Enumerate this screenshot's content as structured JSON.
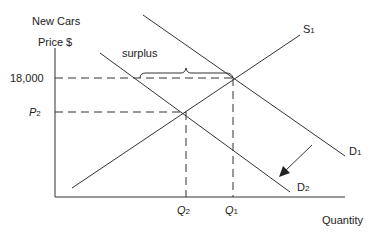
{
  "diagram": {
    "title_line1": "New Cars",
    "y_axis_label": "Price $",
    "x_axis_label": "Quantity",
    "price_labels": {
      "p1": "18,000",
      "p2_letter": "P",
      "p2_sub": "2"
    },
    "quantity_labels": {
      "q2_letter": "Q",
      "q2_sub": "2",
      "q1_letter": "Q",
      "q1_sub": "1"
    },
    "curves": {
      "supply": {
        "letter": "S",
        "sub": "1"
      },
      "demand_original": {
        "letter": "D",
        "sub": "1"
      },
      "demand_new": {
        "letter": "D",
        "sub": "2"
      }
    },
    "annotation": "surplus",
    "colors": {
      "line": "#333333",
      "background": "#ffffff"
    }
  }
}
